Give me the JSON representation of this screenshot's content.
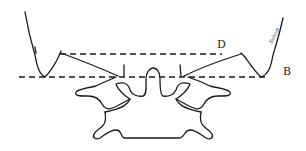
{
  "diagram": {
    "type": "anatomical line drawing",
    "labels": {
      "upper_line": "D",
      "lower_line": "B",
      "annotation": "Sulcus"
    },
    "lines": [
      {
        "name": "D",
        "style": "dashed",
        "y": 54,
        "x_start": 60,
        "x_end": 222
      },
      {
        "name": "B",
        "style": "dashed",
        "y": 77,
        "x_start": 19,
        "x_end": 266
      }
    ],
    "colors": {
      "ink": "#1a1a1a",
      "background": "#ffffff"
    }
  }
}
